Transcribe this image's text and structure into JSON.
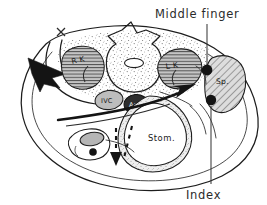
{
  "figure": {
    "background_color": "#ffffff",
    "ink_color": "#1d1d1d",
    "style": "hand-drawn line art with stipple and hatch shading"
  },
  "annotations": {
    "middle_finger": {
      "label": "Middle finger",
      "x": 186,
      "y": 16,
      "dot_x": 207,
      "dot_y": 70,
      "dot_radius": 5.4,
      "leader_from_y": 24,
      "leader_to_y": 65
    },
    "index": {
      "label": "Index",
      "x": 201,
      "y": 197,
      "dot_x": 211,
      "dot_y": 100,
      "dot_radius": 5.2,
      "leader_from_y": 106,
      "leader_to_y": 184
    }
  },
  "organs": [
    {
      "id": "right-kidney",
      "label": "R K",
      "label_x": 75,
      "label_y": 67,
      "fill": "#b9b9b9",
      "shading": "horizontal-hatch",
      "side": "right"
    },
    {
      "id": "left-kidney",
      "label": "L K",
      "label_x": 170,
      "label_y": 70,
      "fill": "#b9b9b9",
      "shading": "horizontal-hatch",
      "side": "left"
    },
    {
      "id": "spleen",
      "label": "Sp.",
      "label_x": 224,
      "label_y": 80,
      "fill": "#d0d0d0",
      "shading": "diagonal-hatch",
      "side": "left"
    },
    {
      "id": "inferior-vena-cava",
      "label": "IVC",
      "label_x": 105,
      "label_y": 103,
      "fill": "#bdbdbd",
      "shading": "solid-light",
      "side": "right"
    },
    {
      "id": "aorta",
      "label": "Ao",
      "label_x": 135,
      "label_y": 108,
      "fill": "#2e2e2e",
      "shading": "solid-dark",
      "side": "left"
    },
    {
      "id": "stomach",
      "label": "Stom.",
      "label_x": 160,
      "label_y": 140,
      "fill": "#ffffff",
      "shading": "double-wall-stipple",
      "side": "center"
    },
    {
      "id": "gallbladder-colon",
      "label": "",
      "label_x": 0,
      "label_y": 0,
      "fill": "#b5b5b5",
      "shading": "solid-light",
      "side": "right"
    }
  ],
  "skeletal": {
    "vertebra": {
      "id": "lumbar-vertebra",
      "canal_label": "",
      "fill": "#ffffff"
    }
  },
  "textures": {
    "retroperitoneal_stipple": "#6e6e6e",
    "hatch_line": "#3c3c3c"
  },
  "arrows": [
    {
      "id": "posterior-hand-arrow",
      "direction": "left-down",
      "style": "solid-filled",
      "description": "large solid arrowhead at left flank"
    },
    {
      "id": "anterior-push-arrow",
      "direction": "up-right",
      "style": "solid-tapered",
      "description": "arrow sweeping toward spleen"
    },
    {
      "id": "displacement-arrow",
      "direction": "down",
      "style": "dashed",
      "description": "dashed arrow below gallbladder"
    }
  ],
  "markers": [
    {
      "id": "x-marker",
      "glyph": "x",
      "x": 61,
      "y": 32
    }
  ]
}
